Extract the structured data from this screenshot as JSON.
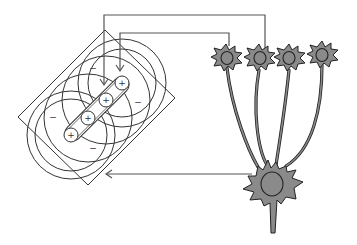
{
  "diagram": {
    "field": {
      "on_center_label": "+",
      "off_surround_label": "−",
      "on_centers": [
        {
          "x": 122,
          "y": 83
        },
        {
          "x": 106,
          "y": 100
        },
        {
          "x": 88,
          "y": 118
        },
        {
          "x": 71,
          "y": 135
        }
      ],
      "off_labels": [
        {
          "x": 93,
          "y": 68
        },
        {
          "x": 138,
          "y": 102
        },
        {
          "x": 53,
          "y": 117
        },
        {
          "x": 93,
          "y": 148
        }
      ]
    },
    "colors": {
      "line": "#333333",
      "wire": "#555555",
      "neuron_fill": "#8a8a8a",
      "neuron_stroke": "#222222",
      "background": "#ffffff"
    }
  }
}
